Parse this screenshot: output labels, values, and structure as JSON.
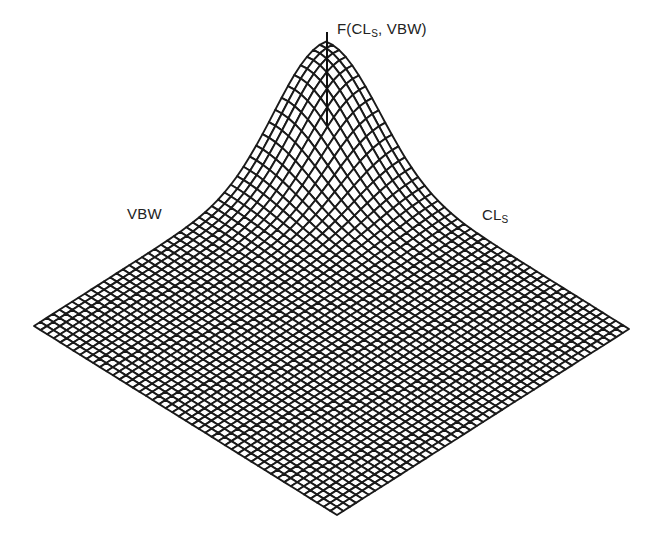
{
  "chart_data": {
    "type": "surface3d",
    "title": "",
    "axes": {
      "z": {
        "label": "F(CL",
        "label_sub": "S",
        "label_tail": ", VBW)"
      },
      "x": {
        "label": "CL",
        "label_sub": "S"
      },
      "y": {
        "label": "VBW"
      }
    },
    "ticks": "none",
    "grid": "mesh",
    "surface": {
      "grid_n": 46,
      "peak_u": 0.02,
      "peak_v": 0.02,
      "sigma_u": 0.16,
      "sigma_v": 0.16,
      "peak_height_px": 100
    },
    "projection": {
      "back": [
        326,
        140
      ],
      "left": [
        34,
        326
      ],
      "right": [
        629,
        329
      ],
      "front": [
        325,
        517
      ]
    },
    "z_axis_line": {
      "x": 327,
      "y_top": 32,
      "y_bottom": 125
    },
    "colors": {
      "mesh": "#1a1a1a",
      "background": "#ffffff"
    }
  }
}
